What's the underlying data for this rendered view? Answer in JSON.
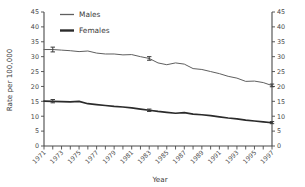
{
  "chart_data": {
    "type": "line",
    "title": "",
    "xlabel": "Year",
    "ylabel": "Rate per 100,000",
    "xlim": [
      1971,
      1997
    ],
    "ylim": [
      0,
      45
    ],
    "ytick_labels": [
      "0",
      "5",
      "10",
      "15",
      "20",
      "25",
      "30",
      "35",
      "40",
      "45"
    ],
    "ytick_values": [
      0,
      5,
      10,
      15,
      20,
      25,
      30,
      35,
      40,
      45
    ],
    "right_axis": true,
    "right_ytick_labels": [
      "0",
      "5",
      "10",
      "15",
      "20",
      "25",
      "30",
      "35",
      "40",
      "45"
    ],
    "grid": false,
    "legend_position": "top-left",
    "x": [
      1971,
      1972,
      1973,
      1974,
      1975,
      1976,
      1977,
      1978,
      1979,
      1980,
      1981,
      1982,
      1983,
      1984,
      1985,
      1986,
      1987,
      1988,
      1989,
      1990,
      1991,
      1992,
      1993,
      1994,
      1995,
      1996,
      1997
    ],
    "xtick_labels": [
      "1971",
      "1973",
      "1975",
      "1977",
      "1979",
      "1981",
      "1983",
      "1985",
      "1987",
      "1989",
      "1991",
      "1993",
      "1995",
      "1997"
    ],
    "xtick_label_rotation": 45,
    "series": [
      {
        "name": "Males",
        "color": "#5f5f5f",
        "values": [
          32.4,
          32.4,
          32.2,
          32.0,
          31.7,
          31.9,
          31.2,
          30.9,
          30.9,
          30.6,
          30.7,
          30.0,
          29.4,
          27.9,
          27.3,
          27.9,
          27.5,
          26.0,
          25.7,
          25.0,
          24.3,
          23.4,
          22.8,
          21.7,
          21.8,
          21.3,
          20.3
        ]
      },
      {
        "name": "Females",
        "color": "#2b2b2b",
        "values": [
          15.1,
          15.0,
          14.9,
          14.8,
          15.0,
          14.2,
          13.9,
          13.6,
          13.3,
          13.1,
          12.8,
          12.4,
          12.0,
          11.6,
          11.3,
          11.0,
          11.2,
          10.7,
          10.5,
          10.2,
          9.8,
          9.4,
          9.1,
          8.7,
          8.4,
          8.1,
          7.8
        ]
      }
    ],
    "error_bars": [
      {
        "series": "Males",
        "year": 1972,
        "value": 32.4,
        "low": 31.6,
        "high": 33.2
      },
      {
        "series": "Males",
        "year": 1983,
        "value": 29.4,
        "low": 28.8,
        "high": 30.0
      },
      {
        "series": "Males",
        "year": 1997,
        "value": 20.3,
        "low": 19.9,
        "high": 20.8
      },
      {
        "series": "Females",
        "year": 1972,
        "value": 15.0,
        "low": 14.5,
        "high": 15.6
      },
      {
        "series": "Females",
        "year": 1983,
        "value": 12.0,
        "low": 11.6,
        "high": 12.4
      },
      {
        "series": "Females",
        "year": 1997,
        "value": 7.8,
        "low": 7.5,
        "high": 8.2
      }
    ]
  },
  "legend": {
    "items": [
      {
        "label": "Males"
      },
      {
        "label": "Females"
      }
    ]
  }
}
